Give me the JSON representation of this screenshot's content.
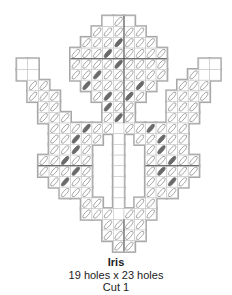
{
  "pattern": {
    "name": "Iris",
    "dimensions": "19 holes x 23 holes",
    "cut": "Cut 1",
    "grid": {
      "origin_x": 17,
      "origin_y": 16,
      "cell": 10.7,
      "cols": 19,
      "rows": 22
    },
    "colors": {
      "outline": "#a8a8a8",
      "gridline": "#c8c8c8",
      "stitch_light": "#ffffff",
      "stitch_light_stroke": "#8a8a8a",
      "stitch_dark": "#6a6a6a",
      "center_line": "#333333"
    },
    "rows": [
      {
        "r": 0,
        "spans": [
          [
            8,
            10
          ]
        ]
      },
      {
        "r": 1,
        "spans": [
          [
            7,
            11
          ]
        ]
      },
      {
        "r": 2,
        "spans": [
          [
            6,
            12
          ]
        ]
      },
      {
        "r": 3,
        "spans": [
          [
            5,
            13
          ]
        ]
      },
      {
        "r": 4,
        "spans": [
          [
            0,
            1
          ],
          [
            5,
            13
          ],
          [
            17,
            18
          ]
        ]
      },
      {
        "r": 5,
        "spans": [
          [
            0,
            1
          ],
          [
            5,
            13
          ],
          [
            16,
            18
          ]
        ]
      },
      {
        "r": 6,
        "spans": [
          [
            1,
            2
          ],
          [
            6,
            12
          ],
          [
            15,
            17
          ]
        ]
      },
      {
        "r": 7,
        "spans": [
          [
            1,
            3
          ],
          [
            7,
            11
          ],
          [
            14,
            17
          ]
        ]
      },
      {
        "r": 8,
        "spans": [
          [
            2,
            3
          ],
          [
            8,
            10
          ],
          [
            14,
            16
          ]
        ]
      },
      {
        "r": 9,
        "spans": [
          [
            2,
            4
          ],
          [
            8,
            10
          ],
          [
            14,
            16
          ]
        ]
      },
      {
        "r": 10,
        "spans": [
          [
            3,
            8
          ],
          [
            9,
            9
          ],
          [
            10,
            15
          ]
        ]
      },
      {
        "r": 11,
        "spans": [
          [
            3,
            7
          ],
          [
            9,
            9
          ],
          [
            11,
            15
          ]
        ]
      },
      {
        "r": 12,
        "spans": [
          [
            3,
            6
          ],
          [
            9,
            9
          ],
          [
            12,
            15
          ]
        ]
      },
      {
        "r": 13,
        "spans": [
          [
            2,
            6
          ],
          [
            9,
            9
          ],
          [
            12,
            16
          ]
        ]
      },
      {
        "r": 14,
        "spans": [
          [
            2,
            6
          ],
          [
            9,
            9
          ],
          [
            12,
            16
          ]
        ]
      },
      {
        "r": 15,
        "spans": [
          [
            3,
            6
          ],
          [
            9,
            9
          ],
          [
            12,
            15
          ]
        ]
      },
      {
        "r": 16,
        "spans": [
          [
            4,
            6
          ],
          [
            9,
            9
          ],
          [
            12,
            14
          ]
        ]
      },
      {
        "r": 17,
        "spans": [
          [
            6,
            7
          ],
          [
            9,
            9
          ],
          [
            11,
            12
          ]
        ]
      },
      {
        "r": 18,
        "spans": [
          [
            6,
            8
          ],
          [
            9,
            9
          ],
          [
            10,
            12
          ]
        ]
      },
      {
        "r": 19,
        "spans": [
          [
            8,
            11
          ]
        ]
      },
      {
        "r": 20,
        "spans": [
          [
            8,
            11
          ]
        ]
      },
      {
        "r": 21,
        "spans": [
          [
            9,
            10
          ]
        ]
      }
    ],
    "dark_stitches": [
      [
        2,
        9
      ],
      [
        3,
        8
      ],
      [
        4,
        9
      ],
      [
        5,
        7
      ],
      [
        6,
        6
      ],
      [
        6,
        11
      ],
      [
        7,
        8
      ],
      [
        7,
        10
      ],
      [
        8,
        8
      ],
      [
        9,
        9
      ],
      [
        10,
        6
      ],
      [
        10,
        12
      ],
      [
        11,
        5
      ],
      [
        11,
        13
      ],
      [
        12,
        5
      ],
      [
        12,
        13
      ],
      [
        13,
        4
      ],
      [
        13,
        14
      ],
      [
        14,
        5
      ],
      [
        14,
        13
      ],
      [
        15,
        4
      ],
      [
        15,
        14
      ]
    ],
    "empty_cells": [
      [
        10,
        9
      ],
      [
        11,
        9
      ],
      [
        12,
        9
      ],
      [
        13,
        9
      ],
      [
        14,
        9
      ],
      [
        15,
        9
      ],
      [
        16,
        9
      ],
      [
        17,
        9
      ],
      [
        18,
        9
      ],
      [
        0,
        8
      ],
      [
        0,
        10
      ],
      [
        4,
        0
      ],
      [
        4,
        1
      ],
      [
        4,
        17
      ],
      [
        4,
        18
      ],
      [
        5,
        0
      ],
      [
        5,
        1
      ],
      [
        5,
        17
      ],
      [
        5,
        18
      ]
    ]
  }
}
